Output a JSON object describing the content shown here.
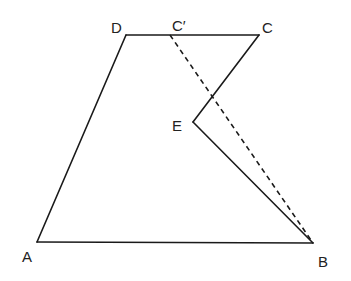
{
  "diagram": {
    "type": "geometry-figure",
    "points": {
      "A": {
        "label": "A",
        "x": 37,
        "y": 242,
        "label_x": 22,
        "label_y": 262
      },
      "B": {
        "label": "B",
        "x": 313,
        "y": 243,
        "label_x": 318,
        "label_y": 267
      },
      "C": {
        "label": "C",
        "x": 259,
        "y": 35,
        "label_x": 262,
        "label_y": 33
      },
      "D": {
        "label": "D",
        "x": 126,
        "y": 35,
        "label_x": 111,
        "label_y": 33
      },
      "E": {
        "label": "E",
        "x": 193,
        "y": 122,
        "label_x": 172,
        "label_y": 131
      },
      "C_prime": {
        "label": "C′",
        "x": 170,
        "y": 35,
        "label_x": 172,
        "label_y": 31
      }
    },
    "solid_segments": [
      [
        "A",
        "B"
      ],
      [
        "A",
        "D"
      ],
      [
        "D",
        "C"
      ],
      [
        "C",
        "E"
      ],
      [
        "E",
        "B"
      ]
    ],
    "dashed_segments": [
      [
        "C_prime",
        "B"
      ]
    ],
    "colors": {
      "line": "#1a1a1a",
      "label": "#222222",
      "background": "#ffffff"
    }
  }
}
